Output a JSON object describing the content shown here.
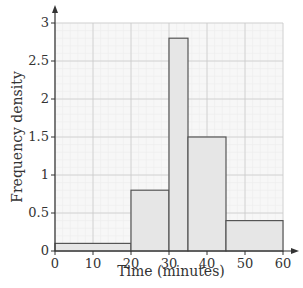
{
  "chart_data": {
    "type": "bar",
    "subtype": "histogram",
    "title": "",
    "xlabel": "Time (minutes)",
    "ylabel": "Frequency density",
    "xlim": [
      0,
      60
    ],
    "ylim": [
      0,
      3
    ],
    "xticks": [
      0,
      10,
      20,
      30,
      40,
      50,
      60
    ],
    "yticks": [
      0,
      0.5,
      1,
      1.5,
      2,
      2.5,
      3
    ],
    "grid": true,
    "bins": [
      {
        "from": 0,
        "to": 20,
        "frequency_density": 0.1
      },
      {
        "from": 20,
        "to": 30,
        "frequency_density": 0.8
      },
      {
        "from": 30,
        "to": 35,
        "frequency_density": 2.8
      },
      {
        "from": 35,
        "to": 45,
        "frequency_density": 1.5
      },
      {
        "from": 45,
        "to": 60,
        "frequency_density": 0.4
      }
    ],
    "colors": {
      "bar_fill": "#e6e6e6",
      "bar_edge": "#555555",
      "grid_major": "#cccccc",
      "grid_minor": "#ececec"
    }
  }
}
